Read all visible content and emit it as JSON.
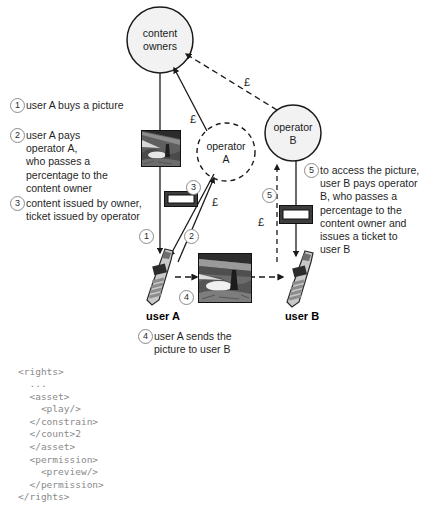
{
  "figure": {
    "title_visible": false,
    "background": "#ffffff",
    "ink": "#1a1a1a",
    "code_color": "#8a8a8a",
    "circle_stroke": "#8b8b8b"
  },
  "nodes": {
    "content_owners": {
      "label": "content\nowners",
      "shape": "circle-solid"
    },
    "operator_a": {
      "label": "operator\nA",
      "shape": "circle-dashed"
    },
    "operator_b": {
      "label": "operator\nB",
      "shape": "circle-solid"
    },
    "user_a": {
      "label": "user A",
      "icon": "mobile-phone-icon"
    },
    "user_b": {
      "label": "user B",
      "icon": "mobile-phone-icon"
    }
  },
  "money_labels": {
    "owner_from_operator_a": "£",
    "owner_from_operator_b": "£",
    "operator_a_from_user_a": "£",
    "operator_b_from_user_b": "£"
  },
  "steps": {
    "one": {
      "num": "1",
      "text": "user A buys a picture"
    },
    "two": {
      "num": "2",
      "text": "user A pays\noperator A,\nwho passes a\npercentage to the\ncontent owner"
    },
    "three": {
      "num": "3",
      "text": "content issued by owner,\nticket issued by operator"
    },
    "four": {
      "num": "4",
      "text": "user A sends the\npicture to user B"
    },
    "five": {
      "num": "5",
      "text": "to access the picture,\nuser B pays operator\nB, who passes a\npercentage to the\ncontent owner and\nissues a ticket to\nuser B"
    }
  },
  "markers": {
    "m1": "1",
    "m2": "2",
    "m3": "3",
    "m4": "4",
    "m5": "5"
  },
  "icons": {
    "picture_top": "landscape-photo-icon",
    "picture_bottom": "landscape-photo-icon",
    "ticket_left": "ticket-icon",
    "ticket_right": "ticket-icon"
  },
  "code": {
    "language": "xml",
    "text": "<rights>\n  ...\n  <asset>\n    <play/>\n  </constrain>\n  </count>2\n  </asset>\n  <permission>\n    <preview/>\n  </permission>\n</rights>"
  }
}
